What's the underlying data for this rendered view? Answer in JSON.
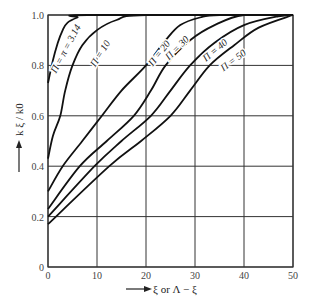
{
  "chart_data": {
    "type": "line",
    "title": "",
    "xlabel": "ξ or Λ − ξ",
    "ylabel": "k ξ / k0",
    "xlim": [
      0,
      50
    ],
    "ylim": [
      0,
      1.0
    ],
    "grid": true,
    "legend": "inline curve labels",
    "x_ticks": [
      "0",
      "10",
      "20",
      "30",
      "40",
      "50"
    ],
    "y_ticks": [
      "0",
      "0.2",
      "0.4",
      "0.6",
      "0.8",
      "1.0"
    ],
    "series": [
      {
        "name": "Π = π = 3.14",
        "points": [
          [
            0,
            0.73
          ],
          [
            1,
            0.82
          ],
          [
            2,
            0.89
          ],
          [
            3,
            0.94
          ],
          [
            4,
            0.97
          ],
          [
            6,
            0.99
          ],
          [
            8,
            1.0
          ],
          [
            50,
            1.0
          ]
        ]
      },
      {
        "name": "Π = 10",
        "points": [
          [
            0,
            0.43
          ],
          [
            1,
            0.52
          ],
          [
            2.5,
            0.6
          ],
          [
            3.5,
            0.7
          ],
          [
            5,
            0.8
          ],
          [
            7,
            0.88
          ],
          [
            10,
            0.94
          ],
          [
            14,
            0.98
          ],
          [
            20,
            1.0
          ],
          [
            50,
            1.0
          ]
        ]
      },
      {
        "name": "Π = 20",
        "points": [
          [
            0,
            0.3
          ],
          [
            3,
            0.4
          ],
          [
            7,
            0.5
          ],
          [
            11,
            0.6
          ],
          [
            15,
            0.7
          ],
          [
            20,
            0.8
          ],
          [
            24,
            0.9
          ],
          [
            27,
            0.96
          ],
          [
            31,
            0.99
          ],
          [
            35,
            1.0
          ],
          [
            50,
            1.0
          ]
        ]
      },
      {
        "name": "Π = 30",
        "points": [
          [
            0,
            0.23
          ],
          [
            6.5,
            0.4
          ],
          [
            12,
            0.5
          ],
          [
            17.5,
            0.6
          ],
          [
            21,
            0.7
          ],
          [
            24,
            0.8
          ],
          [
            29,
            0.9
          ],
          [
            34,
            0.96
          ],
          [
            40,
            1.0
          ],
          [
            50,
            1.0
          ]
        ]
      },
      {
        "name": "Π = 40",
        "points": [
          [
            0,
            0.2
          ],
          [
            9.5,
            0.4
          ],
          [
            15,
            0.5
          ],
          [
            21,
            0.6
          ],
          [
            25,
            0.7
          ],
          [
            29,
            0.8
          ],
          [
            34,
            0.89
          ],
          [
            40,
            0.96
          ],
          [
            47,
            0.995
          ],
          [
            50,
            1.0
          ]
        ]
      },
      {
        "name": "Π = 50",
        "points": [
          [
            0,
            0.17
          ],
          [
            12.5,
            0.4
          ],
          [
            19,
            0.5
          ],
          [
            25,
            0.6
          ],
          [
            29,
            0.7
          ],
          [
            33,
            0.8
          ],
          [
            38,
            0.88
          ],
          [
            43,
            0.95
          ],
          [
            50,
            1.0
          ]
        ]
      }
    ],
    "curve_labels": [
      {
        "text": "Π = π = 3.14",
        "x": 4.2,
        "y": 0.86,
        "angle": -62
      },
      {
        "text": "Π = 10",
        "x": 11.2,
        "y": 0.84,
        "angle": -58
      },
      {
        "text": "Π = 20",
        "x": 23.2,
        "y": 0.84,
        "angle": -52
      },
      {
        "text": "Π = 30",
        "x": 26.8,
        "y": 0.86,
        "angle": -45
      },
      {
        "text": "Π = 40",
        "x": 34.5,
        "y": 0.85,
        "angle": -40
      },
      {
        "text": "Π = 50",
        "x": 38.2,
        "y": 0.81,
        "angle": -37
      }
    ]
  }
}
